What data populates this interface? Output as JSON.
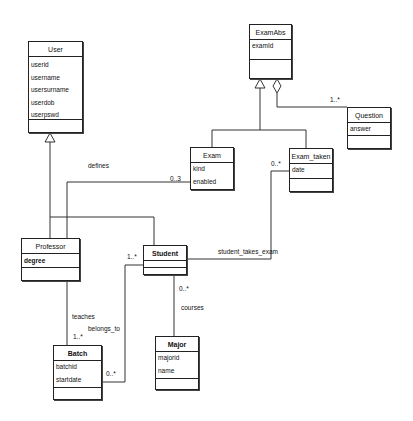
{
  "diagram": {
    "type": "UML class diagram",
    "classes": {
      "user": {
        "name": "User",
        "attributes": [
          "userid",
          "username",
          "usersurname",
          "userdob",
          "userpswd"
        ]
      },
      "examabs": {
        "name": "ExamAbs",
        "attributes": [
          "examId"
        ]
      },
      "question": {
        "name": "Question",
        "attributes": [
          "answer"
        ]
      },
      "exam": {
        "name": "Exam",
        "attributes": [
          "kind",
          "enabled"
        ]
      },
      "exam_taken": {
        "name": "Exam_taken",
        "attributes": [
          "date"
        ]
      },
      "professor": {
        "name": "Professor",
        "attributes": [
          "degree"
        ]
      },
      "student": {
        "name": "Student",
        "attributes": []
      },
      "major": {
        "name": "Major",
        "attributes": [
          "majorid",
          "name"
        ]
      },
      "batch": {
        "name": "Batch",
        "attributes": [
          "batchid",
          "startdate"
        ]
      }
    },
    "labels": {
      "defines": "defines",
      "defines_mult": "0..3",
      "question_mult": "1..*",
      "exam_taken_mult": "0..*",
      "student_takes_exam": "student_takes_exam",
      "student_mult_belongs": "1..*",
      "teaches": "teaches",
      "belongs_to": "belongs_to",
      "batch_teaches_mult": "1..*",
      "batch_belongs_mult": "0..*",
      "student_courses_mult": "0..*",
      "courses": "courses"
    }
  }
}
